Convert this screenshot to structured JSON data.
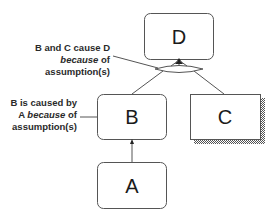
{
  "diagram": {
    "nodes": {
      "D": {
        "label": "D"
      },
      "B": {
        "label": "B"
      },
      "C": {
        "label": "C"
      },
      "A": {
        "label": "A"
      }
    },
    "annotations": {
      "bc_cause_d": {
        "line1": "B and C cause D",
        "line2_italic": "because",
        "line2_rest": " of",
        "line3": "assumption(s)"
      },
      "b_caused_by_a": {
        "line1": "B is caused by",
        "line2_prefix": "A ",
        "line2_italic": "because",
        "line2_rest": " of",
        "line3": "assumption(s)"
      }
    },
    "edges": [
      {
        "from": "A",
        "to": "B"
      },
      {
        "from": "B",
        "to": "D",
        "joint": true
      },
      {
        "from": "C",
        "to": "D",
        "joint": true
      }
    ]
  }
}
